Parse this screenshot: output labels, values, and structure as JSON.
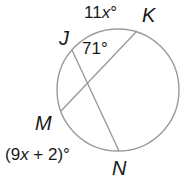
{
  "diagram": {
    "type": "circle-with-intersecting-chords",
    "stroke_color": "#9a9a9a",
    "text_color": "#1a1a1a",
    "circle": {
      "cx": 118,
      "cy": 90,
      "r": 61
    },
    "points": {
      "J": {
        "label": "J",
        "x": 72,
        "y": 50
      },
      "K": {
        "label": "K",
        "x": 137,
        "y": 31
      },
      "M": {
        "label": "M",
        "x": 61,
        "y": 111
      },
      "N": {
        "label": "N",
        "x": 119,
        "y": 151
      }
    },
    "chords": [
      {
        "from": "J",
        "to": "N"
      },
      {
        "from": "K",
        "to": "M"
      }
    ],
    "labels": {
      "arc_jk_coef": "11",
      "arc_jk_var": "x",
      "arc_jk_deg": "°",
      "angle": "71°",
      "arc_mn_open": "(9",
      "arc_mn_var": "x",
      "arc_mn_rest": " + 2)°",
      "point_j": "J",
      "point_k": "K",
      "point_m": "M",
      "point_n": "N"
    }
  }
}
